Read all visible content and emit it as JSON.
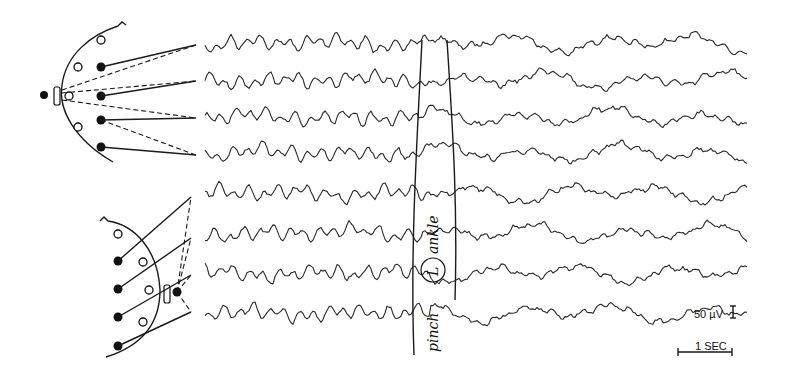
{
  "figure": {
    "type": "eeg-recording",
    "channel_count": 8,
    "upper_montage": {
      "channels": 4,
      "filled_electrodes": 4,
      "open_electrodes": 4
    },
    "lower_montage": {
      "channels": 4,
      "filled_electrodes": 4,
      "open_electrodes": 4
    },
    "annotation": {
      "text_before": "pinch",
      "circled": "L",
      "text_after": "ankle"
    },
    "scale": {
      "amplitude_label": "50 µV",
      "time_label": "1 SEC"
    },
    "colors": {
      "ink": "#1a1a1a",
      "background": "#ffffff"
    }
  }
}
